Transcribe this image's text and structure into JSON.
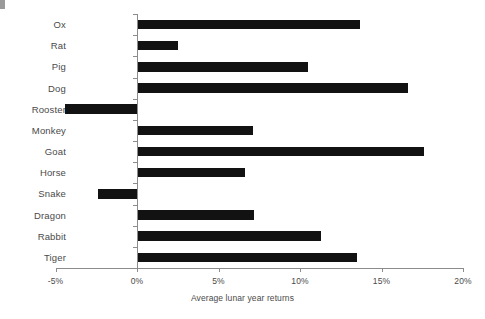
{
  "chart_data": {
    "type": "bar",
    "orientation": "horizontal",
    "title": "",
    "subtitle": "",
    "xlabel": "Average lunar year returns",
    "ylabel": "",
    "xlim": [
      -5,
      20
    ],
    "xticks": [
      -5,
      0,
      5,
      10,
      15,
      20
    ],
    "xtick_labels": [
      "-5%",
      "0%",
      "5%",
      "10%",
      "15%",
      "20%"
    ],
    "grid": false,
    "legend": null,
    "bar_color": "#121212",
    "axis_color": "#8c8c8c",
    "categories": [
      "Ox",
      "Rat",
      "Pig",
      "Dog",
      "Rooster",
      "Monkey",
      "Goat",
      "Horse",
      "Snake",
      "Dragon",
      "Rabbit",
      "Tiger"
    ],
    "values": [
      13.7,
      2.5,
      10.5,
      16.6,
      -4.4,
      7.1,
      17.6,
      6.6,
      -2.4,
      7.2,
      11.3,
      13.5
    ],
    "units": "percent",
    "points": [
      {
        "category": "Ox",
        "value": 13.7,
        "label": "13.7%"
      },
      {
        "category": "Rat",
        "value": 2.5,
        "label": "2.5%"
      },
      {
        "category": "Pig",
        "value": 10.5,
        "label": "10.5%"
      },
      {
        "category": "Dog",
        "value": 16.6,
        "label": "16.6%"
      },
      {
        "category": "Rooster",
        "value": -4.4,
        "label": "-4.4%"
      },
      {
        "category": "Monkey",
        "value": 7.1,
        "label": "7.1%"
      },
      {
        "category": "Goat",
        "value": 17.6,
        "label": "17.6%"
      },
      {
        "category": "Horse",
        "value": 6.6,
        "label": "6.6%"
      },
      {
        "category": "Snake",
        "value": -2.4,
        "label": "-2.4%"
      },
      {
        "category": "Dragon",
        "value": 7.2,
        "label": "7.2%"
      },
      {
        "category": "Rabbit",
        "value": 11.3,
        "label": "11.3%"
      },
      {
        "category": "Tiger",
        "value": 13.5,
        "label": "13.5%"
      }
    ]
  },
  "axis": {
    "x_title": "Average lunar year returns",
    "tick_labels": [
      "-5%",
      "0%",
      "5%",
      "10%",
      "15%",
      "20%"
    ]
  },
  "categories": {
    "ox": "Ox",
    "rat": "Rat",
    "pig": "Pig",
    "dog": "Dog",
    "rooster": "Rooster",
    "monkey": "Monkey",
    "goat": "Goat",
    "horse": "Horse",
    "snake": "Snake",
    "dragon": "Dragon",
    "rabbit": "Rabbit",
    "tiger": "Tiger"
  }
}
